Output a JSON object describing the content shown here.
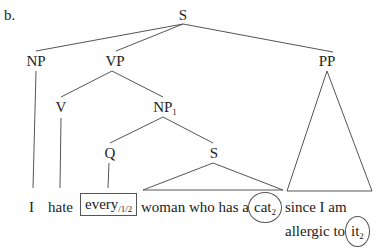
{
  "example_label": "b.",
  "tree": {
    "root": "S",
    "np": "NP",
    "vp": "VP",
    "pp": "PP",
    "v": "V",
    "np1": {
      "base": "NP",
      "sub": "1"
    },
    "q": "Q",
    "inner_s": "S"
  },
  "sentence": {
    "i": "I",
    "hate": "hate",
    "every": {
      "base": "every",
      "sub": "/1/2",
      "boxed": true
    },
    "woman_phrase": "woman who has a",
    "cat": {
      "base": "cat",
      "sub": "2",
      "circled": true
    },
    "since": "since I am",
    "allergic": "allergic to",
    "it": {
      "base": "it",
      "sub": "2",
      "circled": true
    }
  }
}
